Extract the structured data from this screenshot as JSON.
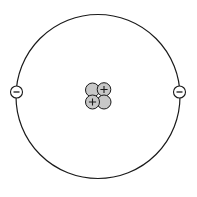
{
  "diagram": {
    "type": "atom-model",
    "background": "#ffffff",
    "stroke_color": "#1a1a1a",
    "particle_fill": "#c8c8c8",
    "electron_fill": "#ffffff",
    "orbit": {
      "cx": 98,
      "cy": 96.5,
      "r": 82
    },
    "nucleus": {
      "particles": [
        {
          "kind": "neutron",
          "cx": 92.5,
          "cy": 90,
          "r": 7,
          "symbol": ""
        },
        {
          "kind": "proton",
          "cx": 104,
          "cy": 89.5,
          "r": 6.8,
          "symbol": "+"
        },
        {
          "kind": "neutron",
          "cx": 104,
          "cy": 102,
          "r": 7,
          "symbol": ""
        },
        {
          "kind": "proton",
          "cx": 92.5,
          "cy": 102,
          "r": 7,
          "symbol": "+"
        }
      ]
    },
    "electrons": [
      {
        "cx": 16.5,
        "cy": 92,
        "r": 6,
        "symbol": "−"
      },
      {
        "cx": 179.5,
        "cy": 92,
        "r": 6,
        "symbol": "−"
      }
    ]
  }
}
